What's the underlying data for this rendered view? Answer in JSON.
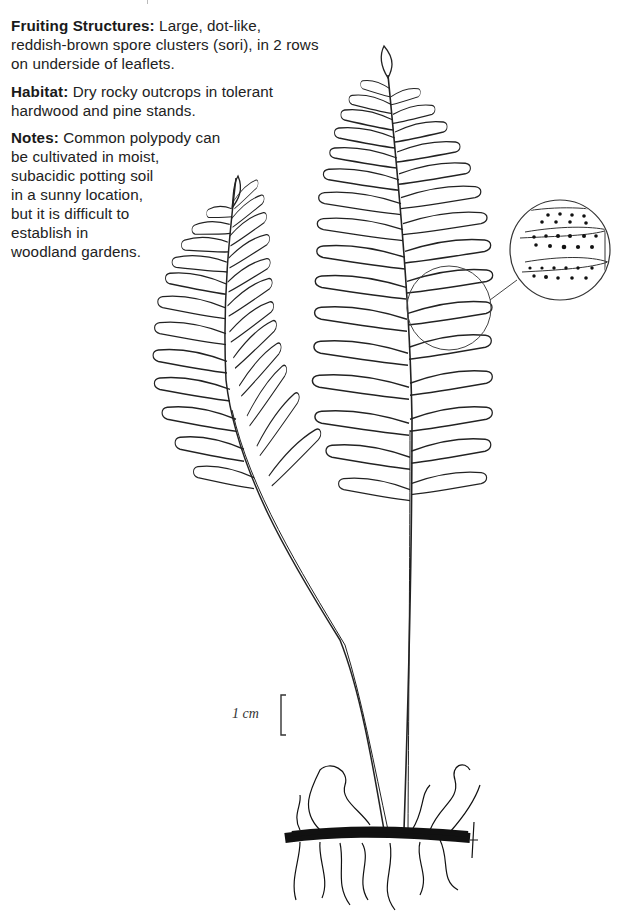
{
  "document": {
    "fruiting": {
      "label": "Fruiting Structures:",
      "text": " Large, dot-like, reddish-brown spore clusters (sori), in 2 rows on underside of leaflets."
    },
    "habitat": {
      "label": "Habitat:",
      "text": " Dry rocky outcrops in tolerant hardwood and pine stands."
    },
    "notes": {
      "label": "Notes:",
      "lines": [
        " Common polypody can",
        "be cultivated in moist,",
        "subacidic potting soil",
        "in a sunny location,",
        "but it is difficult to",
        "establish in",
        "woodland gardens."
      ]
    }
  },
  "illustration": {
    "subject": "Common polypody fern: two fronds with rhizome and roots",
    "inset": "magnified leaflets showing two rows of sori",
    "scale_bar_label": "1 cm"
  },
  "colors": {
    "ink": "#222222",
    "background": "#ffffff"
  }
}
